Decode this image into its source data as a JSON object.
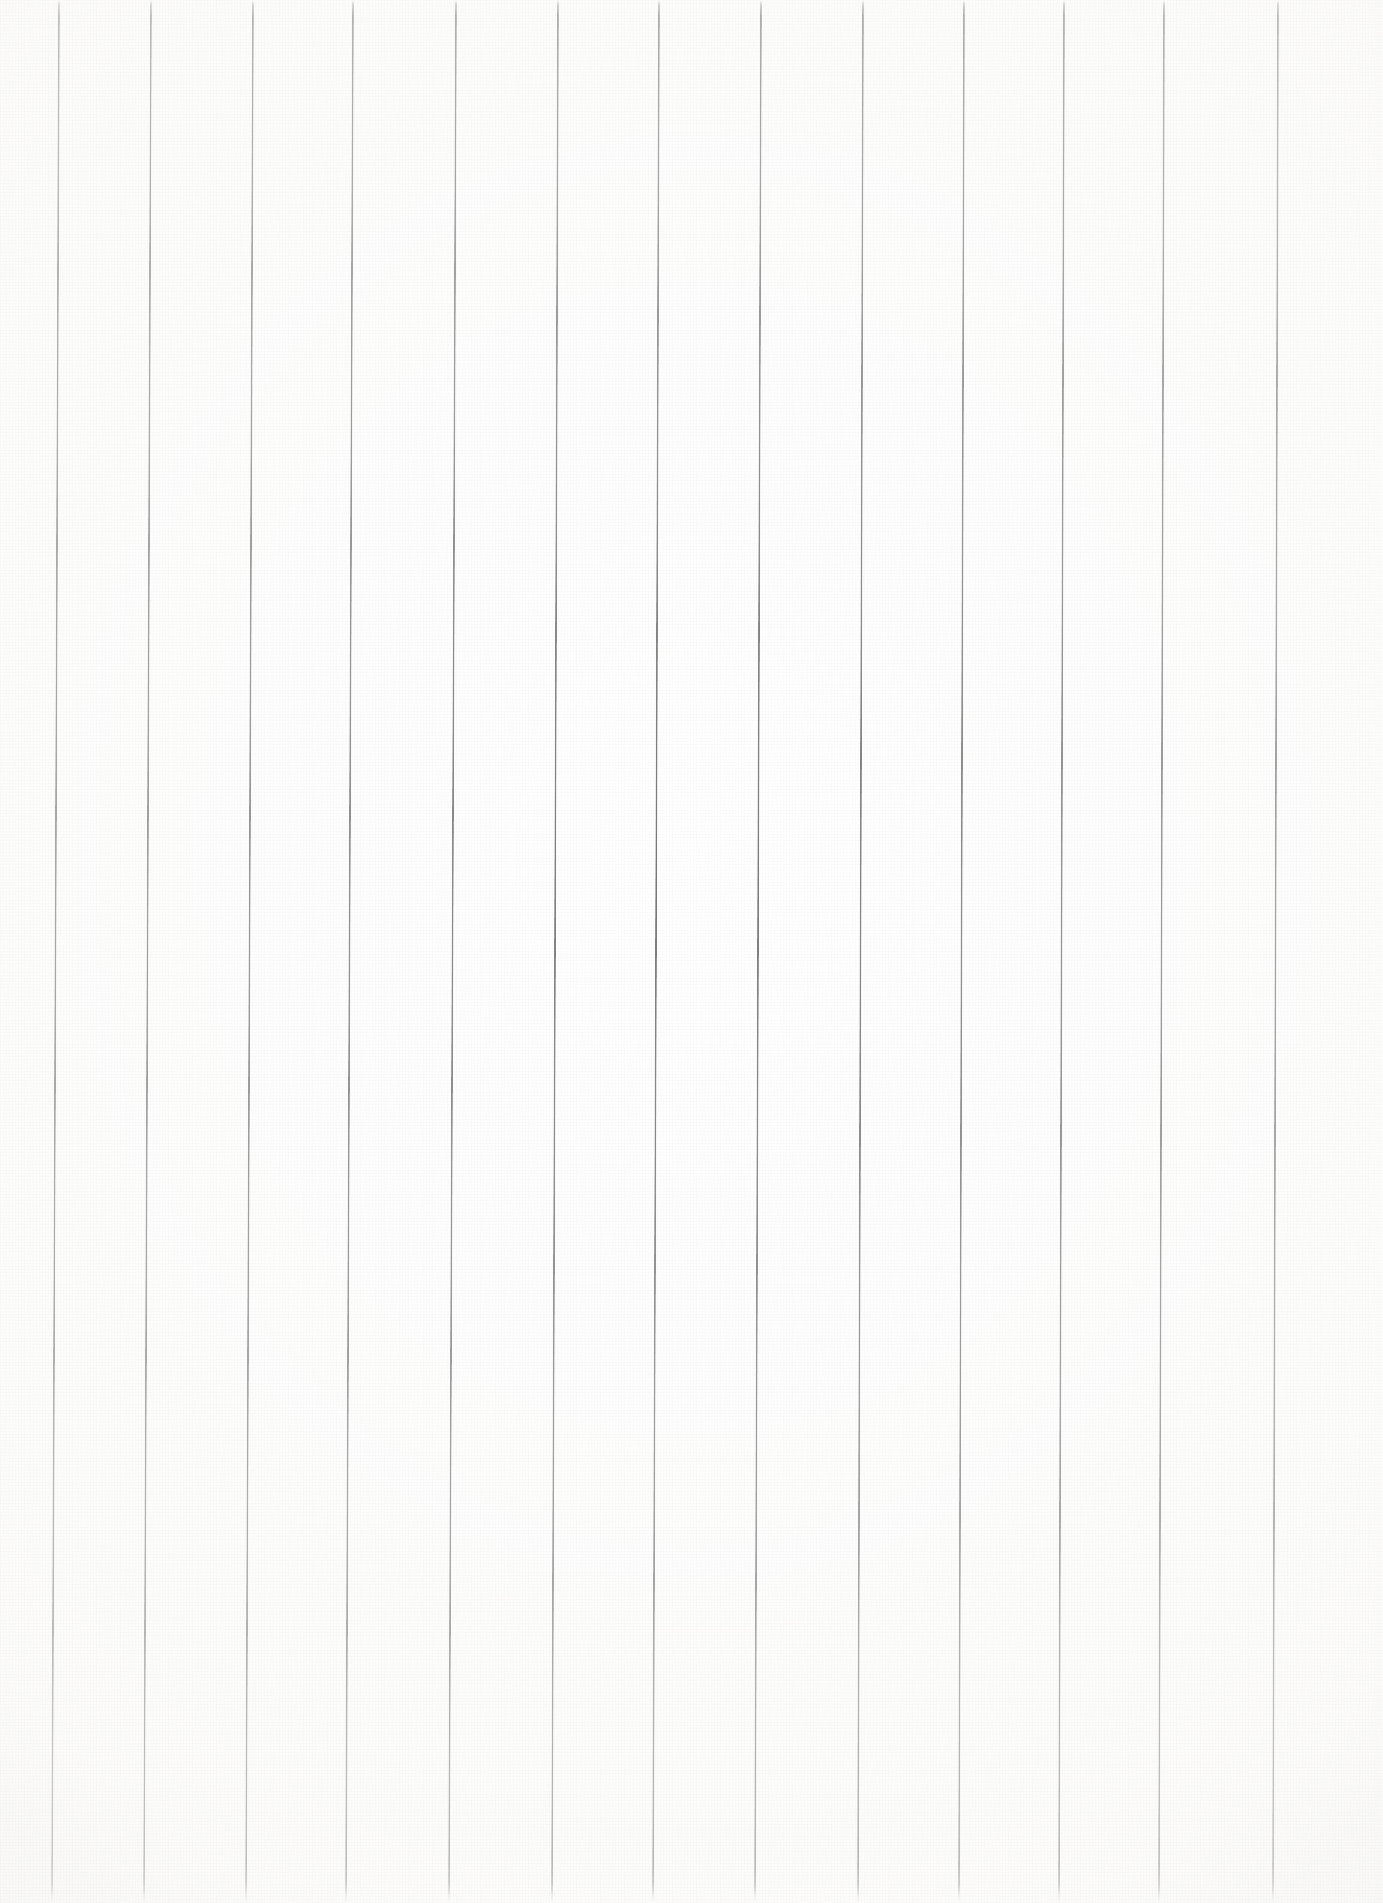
{
  "document": {
    "kind": "scanned-ruled-paper",
    "title": "Blank ruled paper sheet",
    "orientation": "portrait",
    "width_px": 1383,
    "height_px": 1903,
    "background_color": "#fefefe",
    "paper_tint_color": "#f7f6f4",
    "has_text": false,
    "has_handwriting": false,
    "text_content": ""
  },
  "rules": {
    "count": 11,
    "orientation": "vertical",
    "line_color": "#545456",
    "line_width_px": 2,
    "average_spacing_px": 122,
    "tilt_degrees": 0.2,
    "top_fade_px": 16,
    "bottom_fade_px": 20,
    "items": [
      {
        "index": 1,
        "top_x": 58,
        "bottom_x": 65,
        "label": "rule-1"
      },
      {
        "index": 2,
        "top_x": 150,
        "bottom_x": 157,
        "label": "rule-2"
      },
      {
        "index": 3,
        "top_x": 252,
        "bottom_x": 259,
        "label": "rule-3"
      },
      {
        "index": 4,
        "top_x": 352,
        "bottom_x": 359,
        "label": "rule-4"
      },
      {
        "index": 5,
        "top_x": 455,
        "bottom_x": 462,
        "label": "rule-5"
      },
      {
        "index": 6,
        "top_x": 557,
        "bottom_x": 563,
        "label": "rule-6"
      },
      {
        "index": 7,
        "top_x": 658,
        "bottom_x": 664,
        "label": "rule-7"
      },
      {
        "index": 8,
        "top_x": 760,
        "bottom_x": 766,
        "label": "rule-8"
      },
      {
        "index": 9,
        "top_x": 862,
        "bottom_x": 867,
        "label": "rule-9"
      },
      {
        "index": 10,
        "top_x": 963,
        "bottom_x": 968,
        "label": "rule-10"
      },
      {
        "index": 11,
        "top_x": 1063,
        "bottom_x": 1068,
        "label": "rule-11"
      },
      {
        "index": 12,
        "top_x": 1163,
        "bottom_x": 1168,
        "label": "rule-12"
      },
      {
        "index": 13,
        "top_x": 1277,
        "bottom_x": 1282,
        "label": "rule-13"
      }
    ]
  }
}
